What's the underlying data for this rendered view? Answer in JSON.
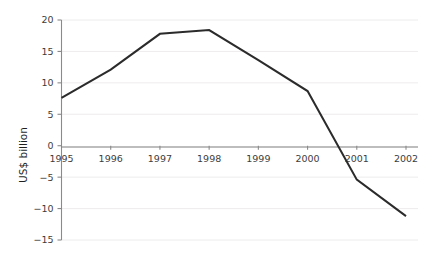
{
  "chart_data": {
    "type": "line",
    "title": "",
    "subtitle": "",
    "xlabel": "",
    "ylabel": "US$ billion",
    "categories": [
      "1995",
      "1996",
      "1997",
      "1998",
      "1999",
      "2000",
      "2001",
      "2002"
    ],
    "x": [
      1995,
      1996,
      1997,
      1998,
      1999,
      2000,
      2001,
      2002
    ],
    "values": [
      7.6,
      12.1,
      17.8,
      18.4,
      13.6,
      8.7,
      -5.4,
      -11.2
    ],
    "series": [
      {
        "name": "",
        "values": [
          7.6,
          12.1,
          17.8,
          18.4,
          13.6,
          8.7,
          -5.4,
          -11.2
        ]
      }
    ],
    "ylim": [
      -15,
      20
    ],
    "xlim": [
      1995,
      2002
    ],
    "yticks": [
      20,
      15,
      10,
      5,
      0,
      -5,
      -10,
      -15
    ],
    "ytick_labels": [
      "20",
      "15",
      "10",
      "5",
      "0",
      "−5",
      "−10",
      "−15"
    ],
    "xticks": [
      1995,
      1996,
      1997,
      1998,
      1999,
      2000,
      2001,
      2002
    ],
    "xtick_labels": [
      "1995",
      "1996",
      "1997",
      "1998",
      "1999",
      "2000",
      "2001",
      "2002"
    ],
    "grid": "horizontal-faint",
    "legend": "none",
    "legend_position": "none",
    "annotations": [],
    "zero_line": 0,
    "xaxis_position": "zero",
    "colors": {
      "line": "#2b2b2b",
      "axis": "#8a8a8a",
      "zero_axis": "#7d7d7d",
      "grid": "#eceaea",
      "tick_text": "#3d3d3d",
      "axis_title": "#1f1f1f",
      "background": "#ffffff"
    }
  }
}
